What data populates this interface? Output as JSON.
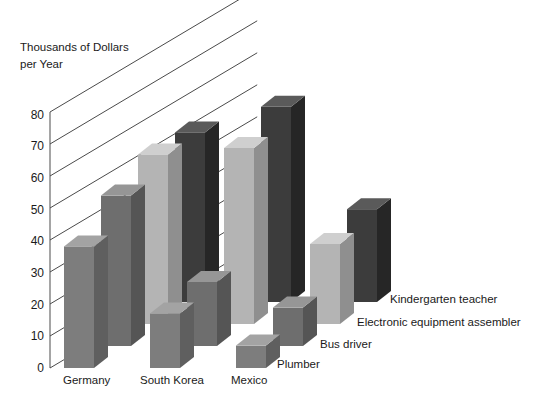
{
  "chart_data": {
    "type": "bar",
    "title": "",
    "ylabel_line1": "Thousands of Dollars",
    "ylabel_line2": "per Year",
    "xlabel": "",
    "categories": [
      "Germany",
      "South Korea",
      "Mexico"
    ],
    "ylim": [
      0,
      80
    ],
    "yticks": [
      0,
      10,
      20,
      30,
      40,
      50,
      60,
      70,
      80
    ],
    "ytick_labels": [
      "0",
      "10",
      "20",
      "30",
      "40",
      "50",
      "60",
      "70",
      "80"
    ],
    "grid": true,
    "legend_position": "right-inline",
    "projection": "3d-depth-rows",
    "series": [
      {
        "name": "Plumber",
        "color": "#7d7d7d",
        "top_color": "#a3a3a3",
        "side_color": "#5f5f5f",
        "values": [
          38,
          17,
          7
        ]
      },
      {
        "name": "Bus driver",
        "color": "#6e6e6e",
        "top_color": "#969696",
        "side_color": "#555555",
        "values": [
          47,
          20,
          12
        ]
      },
      {
        "name": "Electronic equipment assembler",
        "color": "#b4b4b4",
        "top_color": "#cfcfcf",
        "side_color": "#8f8f8f",
        "values": [
          53,
          55,
          25
        ]
      },
      {
        "name": "Kindergarten teacher",
        "color": "#3c3c3c",
        "top_color": "#5a5a5a",
        "side_color": "#262626",
        "values": [
          53,
          61,
          29
        ]
      }
    ]
  },
  "axis": {
    "title_line1": "Thousands of Dollars",
    "title_line2": "per Year",
    "t0": "0",
    "t10": "10",
    "t20": "20",
    "t30": "30",
    "t40": "40",
    "t50": "50",
    "t60": "60",
    "t70": "70",
    "t80": "80"
  },
  "categories": {
    "c0": "Germany",
    "c1": "South Korea",
    "c2": "Mexico"
  },
  "legend": {
    "s0": "Plumber",
    "s1": "Bus driver",
    "s2": "Electronic equipment assembler",
    "s3": "Kindergarten teacher"
  }
}
